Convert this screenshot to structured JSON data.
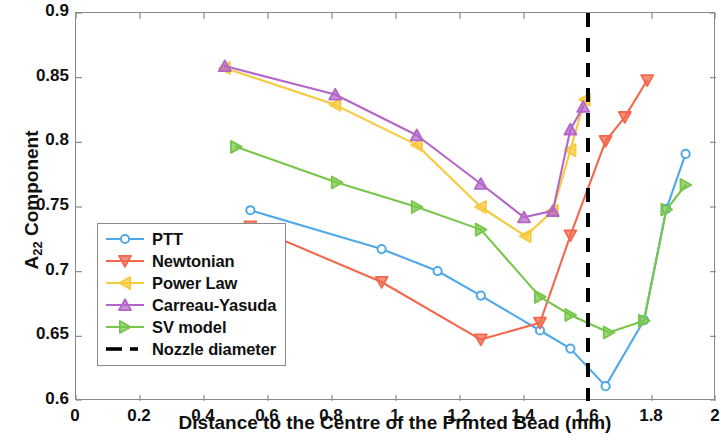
{
  "chart_data": {
    "type": "line",
    "title": "",
    "xlabel": "Distance to the Centre of the Printed Bead (mm)",
    "ylabel": "A22 Component",
    "ylabel_base": "A",
    "ylabel_sub": "22",
    "ylabel_tail": " Component",
    "xlim": [
      0,
      2
    ],
    "ylim": [
      0.6,
      0.9
    ],
    "xticks": [
      0,
      0.2,
      0.4,
      0.6,
      0.8,
      1,
      1.2,
      1.4,
      1.6,
      1.8,
      2
    ],
    "xticklabels": [
      "0",
      "0.2",
      "0.4",
      "0.6",
      "0.8",
      "1",
      "1.2",
      "1.4",
      "1.6",
      "1.8",
      "2"
    ],
    "yticks": [
      0.6,
      0.65,
      0.7,
      0.75,
      0.8,
      0.85,
      0.9
    ],
    "yticklabels": [
      "0.6",
      "0.65",
      "0.7",
      "0.75",
      "0.8",
      "0.85",
      "0.9"
    ],
    "grid": false,
    "legend_position": "lower-left-inside",
    "series": [
      {
        "name": "PTT",
        "color": "#4FA9E8",
        "marker": "circle",
        "x": [
          0.545,
          0.955,
          1.13,
          1.265,
          1.45,
          1.545,
          1.655,
          1.775,
          1.845,
          1.905
        ],
        "y": [
          0.7475,
          0.7175,
          0.7005,
          0.6815,
          0.6545,
          0.6405,
          0.6115,
          0.6625,
          0.7485,
          0.791
        ]
      },
      {
        "name": "Newtonian",
        "color": "#F2684B",
        "marker": "triangle-down",
        "x": [
          0.545,
          0.955,
          1.265,
          1.45,
          1.545,
          1.655,
          1.715,
          1.785
        ],
        "y": [
          0.735,
          0.692,
          0.6475,
          0.6605,
          0.728,
          0.801,
          0.8195,
          0.848
        ]
      },
      {
        "name": "Power Law",
        "color": "#F8C93A",
        "marker": "triangle-left",
        "x": [
          0.465,
          0.81,
          1.065,
          1.265,
          1.405,
          1.49,
          1.545,
          1.59
        ],
        "y": [
          0.8575,
          0.829,
          0.798,
          0.75,
          0.7275,
          0.747,
          0.794,
          0.833
        ]
      },
      {
        "name": "Carreau-Yasuda",
        "color": "#B366C8",
        "marker": "triangle-up",
        "x": [
          0.465,
          0.81,
          1.065,
          1.265,
          1.4,
          1.49,
          1.545,
          1.585
        ],
        "y": [
          0.859,
          0.837,
          0.8055,
          0.768,
          0.742,
          0.747,
          0.81,
          0.8275
        ]
      },
      {
        "name": "SV model",
        "color": "#77C64A",
        "marker": "triangle-right",
        "x": [
          0.5,
          0.815,
          1.065,
          1.265,
          1.45,
          1.545,
          1.665,
          1.775,
          1.845,
          1.905
        ],
        "y": [
          0.7965,
          0.769,
          0.75,
          0.7325,
          0.6805,
          0.6665,
          0.653,
          0.662,
          0.748,
          0.767
        ]
      }
    ],
    "vertical_reference_line": {
      "name": "Nozzle diameter",
      "x": 1.6,
      "color": "#000000",
      "style": "dashed",
      "width": 4
    },
    "legend": [
      {
        "label": "PTT",
        "color": "#4FA9E8",
        "marker": "circle"
      },
      {
        "label": "Newtonian",
        "color": "#F2684B",
        "marker": "triangle-down"
      },
      {
        "label": "Power Law",
        "color": "#F8C93A",
        "marker": "triangle-left"
      },
      {
        "label": "Carreau-Yasuda",
        "color": "#B366C8",
        "marker": "triangle-up"
      },
      {
        "label": "SV model",
        "color": "#77C64A",
        "marker": "triangle-right"
      },
      {
        "label": "Nozzle diameter",
        "color": "#000000",
        "marker": "dashed-line"
      }
    ]
  }
}
